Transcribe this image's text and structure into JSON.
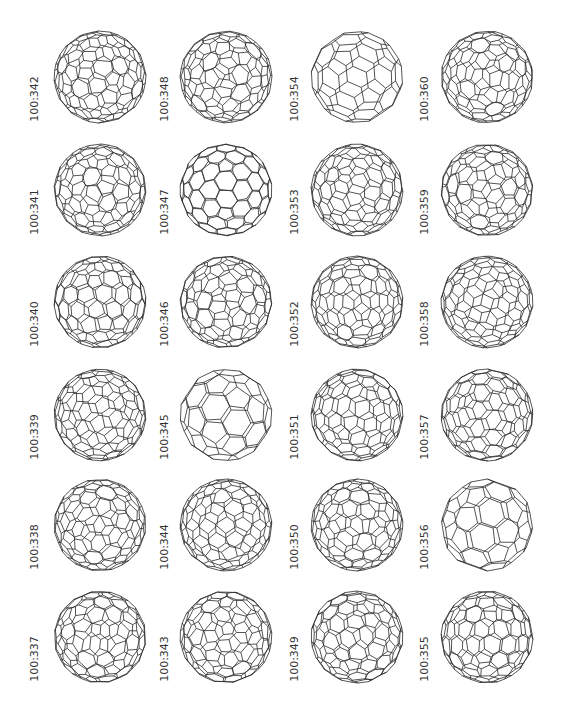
{
  "figure": {
    "columns": 4,
    "rows": 6,
    "line_color": "#2a2a2a",
    "label_color": "#333333",
    "cells": [
      {
        "label": "100:342",
        "col": 0,
        "row": 0,
        "freq": 3,
        "seed": 11,
        "rot": [
          0.6,
          0.3
        ]
      },
      {
        "label": "100:348",
        "col": 1,
        "row": 0,
        "freq": 3,
        "seed": 17,
        "rot": [
          0.2,
          1.1
        ]
      },
      {
        "label": "100:354",
        "col": 2,
        "row": 0,
        "freq": 2,
        "seed": 23,
        "rot": [
          0.9,
          0.4
        ]
      },
      {
        "label": "100:360",
        "col": 3,
        "row": 0,
        "freq": 3,
        "seed": 31,
        "rot": [
          1.3,
          0.7
        ]
      },
      {
        "label": "100:341",
        "col": 0,
        "row": 1,
        "freq": 3,
        "seed": 37,
        "rot": [
          0.1,
          0.9
        ]
      },
      {
        "label": "100:347",
        "col": 1,
        "row": 1,
        "freq": 3,
        "seed": 41,
        "rot": [
          0.0,
          0.0
        ]
      },
      {
        "label": "100:353",
        "col": 2,
        "row": 1,
        "freq": 3,
        "seed": 43,
        "rot": [
          0.7,
          1.4
        ]
      },
      {
        "label": "100:359",
        "col": 3,
        "row": 1,
        "freq": 3,
        "seed": 47,
        "rot": [
          0.4,
          0.2
        ]
      },
      {
        "label": "100:340",
        "col": 0,
        "row": 2,
        "freq": 3,
        "seed": 53,
        "rot": [
          1.0,
          0.5
        ]
      },
      {
        "label": "100:346",
        "col": 1,
        "row": 2,
        "freq": 3,
        "seed": 59,
        "rot": [
          0.3,
          1.2
        ]
      },
      {
        "label": "100:352",
        "col": 2,
        "row": 2,
        "freq": 3,
        "seed": 61,
        "rot": [
          0.8,
          0.1
        ]
      },
      {
        "label": "100:358",
        "col": 3,
        "row": 2,
        "freq": 3,
        "seed": 67,
        "rot": [
          1.2,
          0.9
        ]
      },
      {
        "label": "100:339",
        "col": 0,
        "row": 3,
        "freq": 3,
        "seed": 71,
        "rot": [
          0.5,
          0.6
        ]
      },
      {
        "label": "100:345",
        "col": 1,
        "row": 3,
        "freq": 2,
        "seed": 73,
        "rot": [
          0.2,
          0.3
        ]
      },
      {
        "label": "100:351",
        "col": 2,
        "row": 3,
        "freq": 3,
        "seed": 79,
        "rot": [
          1.1,
          1.0
        ]
      },
      {
        "label": "100:357",
        "col": 3,
        "row": 3,
        "freq": 3,
        "seed": 83,
        "rot": [
          0.6,
          1.5
        ]
      },
      {
        "label": "100:338",
        "col": 0,
        "row": 4,
        "freq": 3,
        "seed": 89,
        "rot": [
          0.3,
          0.8
        ]
      },
      {
        "label": "100:344",
        "col": 1,
        "row": 4,
        "freq": 3,
        "seed": 97,
        "rot": [
          0.9,
          0.2
        ]
      },
      {
        "label": "100:350",
        "col": 2,
        "row": 4,
        "freq": 3,
        "seed": 101,
        "rot": [
          0.1,
          1.3
        ]
      },
      {
        "label": "100:356",
        "col": 3,
        "row": 4,
        "freq": 2,
        "seed": 103,
        "rot": [
          0.7,
          0.5
        ]
      },
      {
        "label": "100:337",
        "col": 0,
        "row": 5,
        "freq": 3,
        "seed": 107,
        "rot": [
          1.4,
          0.4
        ]
      },
      {
        "label": "100:343",
        "col": 1,
        "row": 5,
        "freq": 3,
        "seed": 109,
        "rot": [
          0.4,
          1.0
        ]
      },
      {
        "label": "100:349",
        "col": 2,
        "row": 5,
        "freq": 3,
        "seed": 113,
        "rot": [
          0.8,
          0.8
        ]
      },
      {
        "label": "100:355",
        "col": 3,
        "row": 5,
        "freq": 3,
        "seed": 127,
        "rot": [
          1.0,
          1.2
        ]
      }
    ]
  }
}
